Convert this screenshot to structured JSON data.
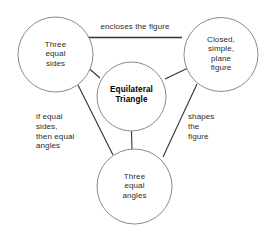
{
  "diagram": {
    "type": "concept-map",
    "title_node": "Equilateral Triangle",
    "nodes": [
      {
        "id": "center",
        "label": "Equilateral\nTriangle",
        "bold": true,
        "cx": 131.5,
        "cy": 96.5,
        "r": 34.5
      },
      {
        "id": "left",
        "label": "Three\nequal\nsides",
        "bold": false,
        "cx": 55.5,
        "cy": 54.5,
        "r": 37.5
      },
      {
        "id": "right",
        "label": "Closed,\nsimple,\nplane\nfigure",
        "bold": false,
        "cx": 221,
        "cy": 54.5,
        "r": 37
      },
      {
        "id": "bottom",
        "label": "Three\nequal\nangles",
        "bold": false,
        "cx": 134.5,
        "cy": 186.5,
        "r": 37.5
      }
    ],
    "edges": [
      {
        "id": "top-edge",
        "from": "left",
        "to": "right",
        "label": "encloses the figure",
        "label_position": "top-center"
      },
      {
        "id": "left-bottom-edge",
        "from": "left",
        "to": "bottom",
        "label": "if equal\nsides,\nthen equal\nangles",
        "label_position": "left"
      },
      {
        "id": "right-bottom-edge",
        "from": "right",
        "to": "bottom",
        "label": "shapes\nthe\nfigure",
        "label_position": "right"
      },
      {
        "id": "center-left-edge",
        "from": "center",
        "to": "left",
        "label": "",
        "label_position": "none"
      },
      {
        "id": "center-right-edge",
        "from": "center",
        "to": "right",
        "label": "",
        "label_position": "none"
      },
      {
        "id": "center-bottom-edge",
        "from": "center",
        "to": "bottom",
        "label": "",
        "label_position": "none"
      }
    ],
    "colors": {
      "background": "#ffffff",
      "circle_stroke": "#8a8a8a",
      "connector_stroke": "#333333",
      "text": "#2b2b2b",
      "center_text": "#000000"
    }
  }
}
